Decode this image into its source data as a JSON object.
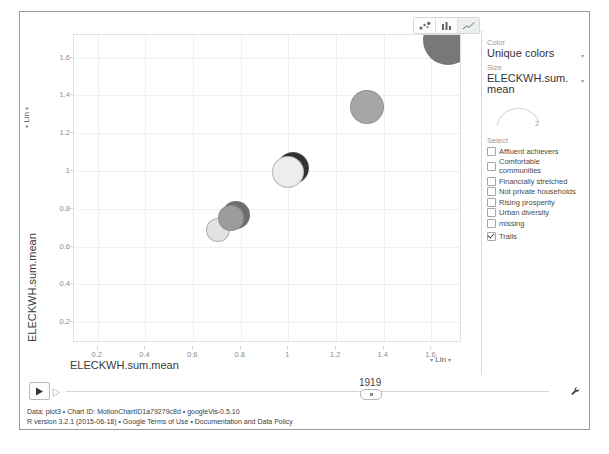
{
  "chart_data": {
    "type": "scatter",
    "title": "",
    "xlabel": "ELECKWH.sum.mean",
    "ylabel": "ELECKWH.sum.mean",
    "xlim": [
      0.1,
      1.72
    ],
    "ylim": [
      0.1,
      1.72
    ],
    "xticks": [
      "0.2",
      "0.4",
      "0.6",
      "0.8",
      "1",
      "1.2",
      "1.4",
      "1.6"
    ],
    "xtickvals": [
      0.2,
      0.4,
      0.6,
      0.8,
      1.0,
      1.2,
      1.4,
      1.6
    ],
    "yticks": [
      "0.2",
      "0.4",
      "0.6",
      "0.8",
      "1",
      "1.2",
      "1.4",
      "1.6"
    ],
    "ytickvals": [
      0.2,
      0.4,
      0.6,
      0.8,
      1.0,
      1.2,
      1.4,
      1.6
    ],
    "grid": true,
    "legend": "none",
    "xscale": "Lin",
    "yscale": "Lin",
    "points": [
      {
        "x": 0.7,
        "y": 0.695,
        "r": 11,
        "color": "#e2e2e2"
      },
      {
        "x": 0.775,
        "y": 0.775,
        "r": 13,
        "color": "#6e6e6e"
      },
      {
        "x": 0.755,
        "y": 0.755,
        "r": 12,
        "color": "#9b9b9b"
      },
      {
        "x": 1.015,
        "y": 1.02,
        "r": 15,
        "color": "#323232"
      },
      {
        "x": 0.995,
        "y": 1.0,
        "r": 15,
        "color": "#ededed"
      },
      {
        "x": 1.325,
        "y": 1.345,
        "r": 16,
        "color": "#a6a6a6"
      },
      {
        "x": 1.665,
        "y": 1.7,
        "r": 24,
        "color": "#787878"
      }
    ]
  },
  "toolbar": {
    "chart_types": [
      {
        "name": "bubble-chart",
        "selected": false
      },
      {
        "name": "bar-chart",
        "selected": false
      },
      {
        "name": "line-chart",
        "selected": true
      }
    ]
  },
  "panel": {
    "color_label": "Color",
    "color_value": "Unique colors",
    "size_label": "Size",
    "size_value": "ELECKWH.sum.mean",
    "size_slider_value": "2",
    "select_label": "Select",
    "items": [
      {
        "label": "Affluent achievers",
        "checked": false
      },
      {
        "label": "Comfortable communities",
        "checked": false
      },
      {
        "label": "Financially stretched",
        "checked": false
      },
      {
        "label": "Not private households",
        "checked": false
      },
      {
        "label": "Rising prosperity",
        "checked": false
      },
      {
        "label": "Urban diversity",
        "checked": false
      },
      {
        "label": "missing",
        "checked": false
      }
    ],
    "trails": {
      "label": "Trails",
      "checked": true
    }
  },
  "timeline": {
    "year": "1919",
    "play_label": "▶"
  },
  "footer": {
    "line1": "Data: plot3 • Chart ID: MotionChartID1a79279c8d • googleVis-0.5.10",
    "line2": "R version 3.2.1 (2015-06-18) • Google Terms of Use • Documentation and Data Policy"
  },
  "axis_scale": {
    "x": "Lin",
    "y": "Lin",
    "caret": "▾"
  }
}
